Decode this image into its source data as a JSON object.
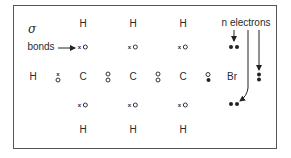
{
  "diagram": {
    "title_symbol": "σ",
    "sigma_label": "bonds",
    "lone_pair_label": "n electrons",
    "atoms": {
      "left_h": "H",
      "carbons": [
        "C",
        "C",
        "C"
      ],
      "top_h": [
        "H",
        "H",
        "H"
      ],
      "bottom_h": [
        "H",
        "H",
        "H"
      ],
      "halogen": "Br"
    },
    "bond_electron_notation": {
      "hydrogen_electron": "x",
      "carbon_electron": "o",
      "bromine_electron": "•"
    },
    "colors": {
      "ink": "#2a2a2a",
      "border": "#555555",
      "background": "#ffffff"
    }
  }
}
